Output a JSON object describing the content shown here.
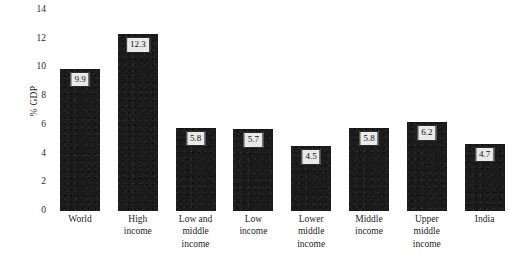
{
  "chart_data": {
    "type": "bar",
    "title": "",
    "xlabel": "",
    "ylabel": "% GDP",
    "ylim": [
      0,
      14
    ],
    "yticks": [
      0,
      2,
      4,
      6,
      8,
      10,
      12,
      14
    ],
    "ytick_labels": [
      "0",
      "2",
      "4",
      "6",
      "8",
      "10",
      "12",
      "14"
    ],
    "grid": false,
    "legend": null,
    "bar_color": "#1b1b1b",
    "label_box_fill": "#e9e9e9",
    "label_box_border": "#2b2b2b",
    "categories": [
      "World",
      "High income",
      "Low and middle income",
      "Low income",
      "Lower middle income",
      "Middle income",
      "Upper middle income",
      "India"
    ],
    "category_lines": [
      [
        "World"
      ],
      [
        "High",
        "income"
      ],
      [
        "Low and",
        "middle",
        "income"
      ],
      [
        "Low",
        "income"
      ],
      [
        "Lower",
        "middle",
        "income"
      ],
      [
        "Middle",
        "income"
      ],
      [
        "Upper",
        "middle",
        "income"
      ],
      [
        "India"
      ]
    ],
    "values": [
      9.9,
      12.3,
      5.8,
      5.7,
      4.5,
      5.8,
      6.2,
      4.7
    ],
    "value_labels": [
      "9.9",
      "12.3",
      "5.8",
      "5.7",
      "4.5",
      "5.8",
      "6.2",
      "4.7"
    ]
  }
}
